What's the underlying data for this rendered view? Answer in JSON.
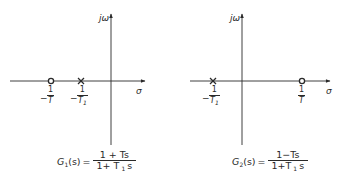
{
  "diagrams": [
    {
      "id": "left",
      "axes": {
        "imag_label": "jω",
        "real_label": "σ"
      },
      "zero": {
        "symbol": "o",
        "label_sign": "−",
        "label_num": "1",
        "label_den": "T"
      },
      "pole": {
        "symbol": "×",
        "label_sign": "−",
        "label_num": "1",
        "label_den": "T1"
      },
      "formula": {
        "lhs": "G1(s)",
        "lhs_name": "G",
        "lhs_sub": "1",
        "lhs_arg": "(s)",
        "eq": "=",
        "numerator": "1 + Ts",
        "denominator": "1+ T1s",
        "den_a": "1+ T",
        "den_sub": "1",
        "den_b": "s"
      }
    },
    {
      "id": "right",
      "axes": {
        "imag_label": "jω",
        "real_label": "σ"
      },
      "pole": {
        "symbol": "×",
        "label_sign": "−",
        "label_num": "1",
        "label_den": "T1"
      },
      "zero": {
        "symbol": "o",
        "label_sign": "",
        "label_num": "1",
        "label_den": "T"
      },
      "formula": {
        "lhs": "G2(s)",
        "lhs_name": "G",
        "lhs_sub": "2",
        "lhs_arg": "(s)",
        "eq": "=",
        "numerator": "1−Ts",
        "denominator": "1+T1s",
        "den_a": "1+T",
        "den_sub": "1",
        "den_b": "s"
      }
    }
  ]
}
